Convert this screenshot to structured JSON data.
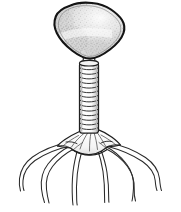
{
  "figure": {
    "title": "Bacteriophage",
    "caption": "",
    "background_color": "#ffffff",
    "width": 181,
    "height": 212,
    "style": "line drawing with stippled shading"
  },
  "colors": {
    "background": "#ffffff",
    "outline": "#1a1a1a",
    "outline_soft": "#3c3c3c",
    "head_fill_light": "#f2f2f2",
    "head_fill_mid": "#d8d8d8",
    "head_fill_dark": "#c2c2c2",
    "stipple": "#9a9a9a",
    "tail_fill": "#fbfbfb",
    "tail_ring_line": "#2b2b2b",
    "baseplate_fill": "#fafafa",
    "fiber_line": "#2a2a2a"
  },
  "parts": {
    "head": {
      "label": "Head (capsid)",
      "shape": "rounded polygonal capsid",
      "fill": "#dcdcdc",
      "texture": "stippled",
      "center_x": 89,
      "center_y": 30,
      "width": 72,
      "height": 56
    },
    "collar": {
      "label": "Collar / neck",
      "center_x": 89,
      "center_y": 60,
      "width": 17,
      "height": 9
    },
    "sheath": {
      "label": "Tail sheath",
      "shape": "striated tube",
      "ring_count": 15,
      "top_y": 64,
      "bottom_y": 133,
      "center_x": 89,
      "width": 19
    },
    "baseplate": {
      "label": "Base plate",
      "center_x": 89,
      "center_y": 144,
      "width": 52,
      "height": 24
    },
    "fibers": {
      "label": "Tail fibers (legs)",
      "count": 6,
      "style": "double-line outlined tube",
      "endpoints": [
        {
          "id": "fiber-left-outer",
          "end_x": 22,
          "end_y": 190
        },
        {
          "id": "fiber-left-mid",
          "end_x": 47,
          "end_y": 203
        },
        {
          "id": "fiber-left-inner",
          "end_x": 75,
          "end_y": 205
        },
        {
          "id": "fiber-right-inner",
          "end_x": 106,
          "end_y": 202
        },
        {
          "id": "fiber-right-mid",
          "end_x": 135,
          "end_y": 201
        },
        {
          "id": "fiber-right-outer",
          "end_x": 163,
          "end_y": 190
        }
      ]
    }
  }
}
